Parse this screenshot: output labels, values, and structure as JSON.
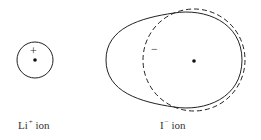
{
  "diagram": {
    "li_ion": {
      "label_base": "Li",
      "label_charge": "+",
      "label_suffix": " ion",
      "charge_symbol": "+"
    },
    "i_ion": {
      "label_base": "I",
      "label_charge": "−",
      "label_suffix": " ion",
      "charge_symbol": "−"
    },
    "colors": {
      "line": "#222222",
      "background": "#ffffff"
    }
  }
}
